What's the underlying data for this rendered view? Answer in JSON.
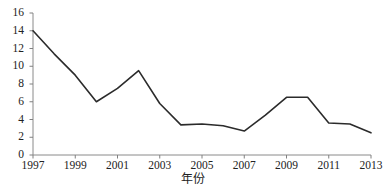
{
  "chart_data": {
    "type": "line",
    "title": "",
    "subtitle": "",
    "xlabel": "年份",
    "ylabel": "",
    "x": [
      1997,
      1998,
      1999,
      2000,
      2001,
      2002,
      2003,
      2004,
      2005,
      2006,
      2007,
      2008,
      2009,
      2010,
      2011,
      2012,
      2013
    ],
    "values": [
      14.0,
      11.4,
      9.0,
      6.0,
      7.5,
      9.5,
      5.8,
      3.4,
      3.5,
      3.3,
      2.7,
      4.5,
      6.5,
      6.5,
      3.6,
      3.5,
      2.5
    ],
    "series": [
      {
        "name": "",
        "values": [
          14.0,
          11.4,
          9.0,
          6.0,
          7.5,
          9.5,
          5.8,
          3.4,
          3.5,
          3.3,
          2.7,
          4.5,
          6.5,
          6.5,
          3.6,
          3.5,
          2.5
        ]
      }
    ],
    "xlim": [
      1997,
      2013
    ],
    "ylim": [
      0,
      16
    ],
    "xticks": [
      1997,
      1999,
      2001,
      2003,
      2005,
      2007,
      2009,
      2011,
      2013
    ],
    "xtick_labels": [
      "1997",
      "1999",
      "2001",
      "2003",
      "2005",
      "2007",
      "2009",
      "2011",
      "2013"
    ],
    "yticks": [
      0,
      2,
      4,
      6,
      8,
      10,
      12,
      14,
      16
    ],
    "ytick_labels": [
      "0",
      "2",
      "4",
      "6",
      "8",
      "10",
      "12",
      "14",
      "16"
    ],
    "grid": false,
    "legend": false,
    "legend_position": "none",
    "line_color": "#2b2b2b",
    "axis_color": "#808080",
    "background_color": "#ffffff",
    "annotations": []
  }
}
